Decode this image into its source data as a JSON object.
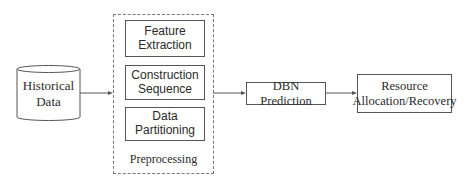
{
  "diagram": {
    "source": {
      "label_line1": "Historical",
      "label_line2": "Data",
      "shape": "cylinder"
    },
    "preprocessing": {
      "group_label": "Preprocessing",
      "steps": [
        {
          "line1": "Feature",
          "line2": "Extraction"
        },
        {
          "line1": "Construction",
          "line2": "Sequence"
        },
        {
          "line1": "Data",
          "line2": "Partitioning"
        }
      ]
    },
    "prediction": {
      "label": "DBN Prediction"
    },
    "output": {
      "label_line1": "Resource",
      "label_line2": "Allocation/Recovery"
    },
    "edges": [
      {
        "from": "Historical Data",
        "to": "Preprocessing"
      },
      {
        "from": "Preprocessing",
        "to": "DBN Prediction"
      },
      {
        "from": "DBN Prediction",
        "to": "Resource Allocation/Recovery"
      }
    ],
    "colors": {
      "stroke": "#555555",
      "text": "#2a2a2a",
      "background": "#ffffff"
    }
  }
}
